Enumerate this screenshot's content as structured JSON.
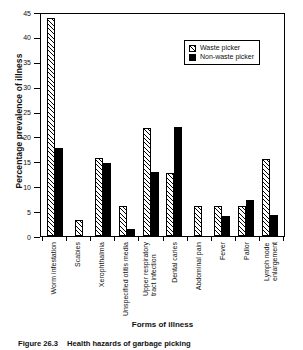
{
  "figure": {
    "caption_number": "Figure 26.3",
    "caption_text": "Health hazards of garbage picking"
  },
  "chart_data": {
    "type": "bar",
    "title": "",
    "xlabel": "Forms of illness",
    "ylabel": "Percentage prevalence of illness",
    "ylim": [
      0,
      45
    ],
    "yticks": [
      0,
      5,
      10,
      15,
      20,
      25,
      30,
      35,
      40,
      45
    ],
    "ytick_labels": [
      "0",
      "5",
      "10",
      "15",
      "20",
      "25",
      "30",
      "35",
      "40",
      "45"
    ],
    "grid": false,
    "legend_position": "top-right",
    "categories": [
      "Worm infestation",
      "Scabies",
      "Xerophthalmia",
      "Unspecified otitis media",
      "Upper respiratory\ntract infection",
      "Dental caries",
      "Abdominal pain",
      "Fever",
      "Pallor",
      "Lymph node\nenlargement"
    ],
    "series": [
      {
        "name": "Waste picker",
        "color": "#ffffff",
        "pattern": "diagonal-hatch",
        "values": [
          43.8,
          3.3,
          15.7,
          6.1,
          21.8,
          12.6,
          6.0,
          6.1,
          6.1,
          15.5
        ]
      },
      {
        "name": "Non-waste picker",
        "color": "#000000",
        "pattern": "solid",
        "values": [
          17.7,
          0,
          14.7,
          1.4,
          12.9,
          21.9,
          0,
          4.1,
          7.3,
          4.2
        ]
      }
    ]
  },
  "legend": {
    "entries": [
      {
        "label": "Waste picker"
      },
      {
        "label": "Non-waste picker"
      }
    ]
  }
}
